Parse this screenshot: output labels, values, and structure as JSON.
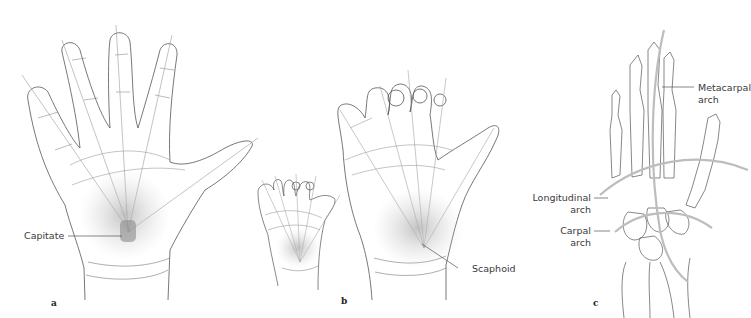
{
  "figure": {
    "panels": [
      {
        "id": "a",
        "letter": "a",
        "description": "Open palm, dorsal-volar view with finger axes converging on capitate",
        "labels": [
          {
            "text": "Capitate"
          }
        ]
      },
      {
        "id": "b",
        "letter": "b",
        "description": "Small and large hands with radiating finger axes",
        "labels": [
          {
            "text": "Scaphoid"
          }
        ]
      },
      {
        "id": "c",
        "letter": "c",
        "description": "Hand skeleton showing arches",
        "labels": [
          {
            "line1": "Metacarpal",
            "line2": "arch"
          },
          {
            "line1": "Longitudinal",
            "line2": "arch"
          },
          {
            "line1": "Carpal",
            "line2": "arch"
          }
        ]
      }
    ],
    "colors": {
      "outline": "#555555",
      "axis": "#9a9a9a",
      "shading": "#c8c8c8",
      "arch": "#bdbdbd",
      "text": "#3a3a3a"
    }
  }
}
